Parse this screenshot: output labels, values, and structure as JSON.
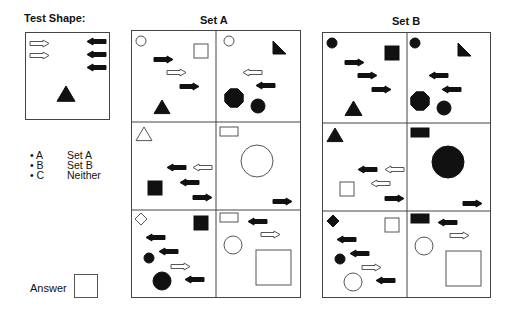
{
  "titles": {
    "test_shape": "Test Shape:",
    "set_a": "Set A",
    "set_b": "Set B"
  },
  "options": [
    {
      "key": "• A",
      "label": "Set A"
    },
    {
      "key": "• B",
      "label": "Set B"
    },
    {
      "key": "• C",
      "label": "Neither"
    }
  ],
  "answer": {
    "label": "Answer",
    "value": ""
  },
  "colors": {
    "ink": "#111111",
    "border": "#444444",
    "background": "#ffffff"
  },
  "test_shape": {
    "box": {
      "x": 25,
      "y": 32,
      "w": 85,
      "h": 88
    },
    "shapes": [
      {
        "type": "arrow",
        "dir": "right",
        "fill": "open",
        "x": 30,
        "y": 40
      },
      {
        "type": "arrow",
        "dir": "right",
        "fill": "open",
        "x": 30,
        "y": 52
      },
      {
        "type": "arrow",
        "dir": "left",
        "fill": "solid",
        "x": 87,
        "y": 38
      },
      {
        "type": "arrow",
        "dir": "left",
        "fill": "solid",
        "x": 87,
        "y": 51
      },
      {
        "type": "arrow",
        "dir": "left",
        "fill": "solid",
        "x": 87,
        "y": 64
      },
      {
        "type": "triangle",
        "fill": "solid",
        "x": 57,
        "y": 86,
        "size": 18
      }
    ]
  },
  "set_a": {
    "box": {
      "x": 131,
      "y": 30,
      "w": 170,
      "h": 268
    },
    "cells": [
      {
        "shapes": [
          {
            "type": "circle",
            "fill": "open",
            "cx": 141,
            "cy": 41,
            "r": 5
          },
          {
            "type": "square",
            "fill": "open",
            "x": 194,
            "y": 44,
            "size": 14
          },
          {
            "type": "arrow",
            "dir": "right",
            "fill": "solid",
            "x": 154,
            "y": 56
          },
          {
            "type": "arrow",
            "dir": "right",
            "fill": "open",
            "x": 167,
            "y": 69
          },
          {
            "type": "arrow",
            "dir": "right",
            "fill": "solid",
            "x": 180,
            "y": 83
          },
          {
            "type": "triangle",
            "fill": "solid",
            "x": 154,
            "y": 100,
            "size": 16
          }
        ]
      },
      {
        "shapes": [
          {
            "type": "circle",
            "fill": "open",
            "cx": 229,
            "cy": 41,
            "r": 5
          },
          {
            "type": "right-triangle",
            "fill": "solid",
            "x": 273,
            "y": 41,
            "size": 13
          },
          {
            "type": "arrow",
            "dir": "left",
            "fill": "open",
            "x": 243,
            "y": 69
          },
          {
            "type": "arrow",
            "dir": "left",
            "fill": "solid",
            "x": 256,
            "y": 82
          },
          {
            "type": "octagon",
            "fill": "solid",
            "cx": 234,
            "cy": 98,
            "r": 10
          },
          {
            "type": "circle",
            "fill": "solid",
            "cx": 258,
            "cy": 106,
            "r": 7
          }
        ]
      },
      {
        "shapes": [
          {
            "type": "triangle",
            "fill": "open",
            "x": 136,
            "y": 127,
            "size": 16
          },
          {
            "type": "arrow",
            "dir": "left",
            "fill": "open",
            "x": 193,
            "y": 164
          },
          {
            "type": "arrow",
            "dir": "left",
            "fill": "solid",
            "x": 167,
            "y": 164
          },
          {
            "type": "arrow",
            "dir": "left",
            "fill": "solid",
            "x": 180,
            "y": 179
          },
          {
            "type": "square",
            "fill": "solid",
            "x": 148,
            "y": 181,
            "size": 14
          },
          {
            "type": "arrow",
            "dir": "right",
            "fill": "solid",
            "x": 193,
            "y": 194
          }
        ]
      },
      {
        "shapes": [
          {
            "type": "rect",
            "fill": "open",
            "x": 220,
            "y": 127,
            "w": 18,
            "h": 9
          },
          {
            "type": "circle",
            "fill": "open",
            "cx": 257,
            "cy": 161,
            "r": 16
          },
          {
            "type": "arrow",
            "dir": "right",
            "fill": "solid",
            "x": 273,
            "y": 198
          }
        ]
      },
      {
        "shapes": [
          {
            "type": "diamond",
            "fill": "open",
            "cx": 141,
            "cy": 219,
            "r": 6
          },
          {
            "type": "square",
            "fill": "solid",
            "x": 194,
            "y": 216,
            "size": 14
          },
          {
            "type": "arrow",
            "dir": "left",
            "fill": "solid",
            "x": 146,
            "y": 234
          },
          {
            "type": "arrow",
            "dir": "left",
            "fill": "solid",
            "x": 159,
            "y": 248
          },
          {
            "type": "circle",
            "fill": "solid",
            "cx": 149,
            "cy": 258,
            "r": 5
          },
          {
            "type": "arrow",
            "dir": "right",
            "fill": "open",
            "x": 171,
            "y": 263
          },
          {
            "type": "arrow",
            "dir": "left",
            "fill": "solid",
            "x": 185,
            "y": 276
          },
          {
            "type": "circle",
            "fill": "solid",
            "cx": 162,
            "cy": 281,
            "r": 9
          }
        ]
      },
      {
        "shapes": [
          {
            "type": "rect",
            "fill": "open",
            "x": 220,
            "y": 213,
            "w": 18,
            "h": 9
          },
          {
            "type": "arrow",
            "dir": "left",
            "fill": "solid",
            "x": 248,
            "y": 218
          },
          {
            "type": "arrow",
            "dir": "right",
            "fill": "open",
            "x": 261,
            "y": 231
          },
          {
            "type": "circle",
            "fill": "open",
            "cx": 233,
            "cy": 245,
            "r": 9
          },
          {
            "type": "square",
            "fill": "open",
            "x": 256,
            "y": 250,
            "size": 35
          }
        ]
      }
    ]
  },
  "set_b": {
    "box": {
      "x": 322,
      "y": 32,
      "w": 169,
      "h": 266
    },
    "cells": [
      {
        "shapes": [
          {
            "type": "circle",
            "fill": "solid",
            "cx": 332,
            "cy": 43,
            "r": 5
          },
          {
            "type": "square",
            "fill": "solid",
            "x": 385,
            "y": 46,
            "size": 14
          },
          {
            "type": "arrow",
            "dir": "right",
            "fill": "solid",
            "x": 345,
            "y": 59
          },
          {
            "type": "arrow",
            "dir": "right",
            "fill": "solid",
            "x": 358,
            "y": 72
          },
          {
            "type": "arrow",
            "dir": "right",
            "fill": "solid",
            "x": 372,
            "y": 86
          },
          {
            "type": "triangle",
            "fill": "solid",
            "x": 345,
            "y": 101,
            "size": 17
          }
        ]
      },
      {
        "shapes": [
          {
            "type": "circle",
            "fill": "solid",
            "cx": 415,
            "cy": 43,
            "r": 5
          },
          {
            "type": "right-triangle",
            "fill": "solid",
            "x": 458,
            "y": 43,
            "size": 13
          },
          {
            "type": "arrow",
            "dir": "left",
            "fill": "solid",
            "x": 429,
            "y": 72
          },
          {
            "type": "arrow",
            "dir": "left",
            "fill": "solid",
            "x": 442,
            "y": 86
          },
          {
            "type": "octagon",
            "fill": "solid",
            "cx": 420,
            "cy": 101,
            "r": 10
          },
          {
            "type": "circle",
            "fill": "solid",
            "cx": 444,
            "cy": 108,
            "r": 7
          }
        ]
      },
      {
        "shapes": [
          {
            "type": "triangle",
            "fill": "solid",
            "x": 327,
            "y": 128,
            "size": 16
          },
          {
            "type": "arrow",
            "dir": "left",
            "fill": "open",
            "x": 385,
            "y": 166
          },
          {
            "type": "arrow",
            "dir": "left",
            "fill": "solid",
            "x": 358,
            "y": 166
          },
          {
            "type": "arrow",
            "dir": "left",
            "fill": "open",
            "x": 371,
            "y": 180
          },
          {
            "type": "square",
            "fill": "open",
            "x": 340,
            "y": 182,
            "size": 14
          },
          {
            "type": "arrow",
            "dir": "right",
            "fill": "solid",
            "x": 385,
            "y": 195
          }
        ]
      },
      {
        "shapes": [
          {
            "type": "rect",
            "fill": "solid",
            "x": 411,
            "y": 128,
            "w": 18,
            "h": 9
          },
          {
            "type": "circle",
            "fill": "solid",
            "cx": 448,
            "cy": 162,
            "r": 16
          },
          {
            "type": "arrow",
            "dir": "right",
            "fill": "solid",
            "x": 463,
            "y": 200
          }
        ]
      },
      {
        "shapes": [
          {
            "type": "diamond",
            "fill": "solid",
            "cx": 333,
            "cy": 221,
            "r": 6
          },
          {
            "type": "square",
            "fill": "open",
            "x": 385,
            "y": 218,
            "size": 14
          },
          {
            "type": "arrow",
            "dir": "left",
            "fill": "solid",
            "x": 337,
            "y": 236
          },
          {
            "type": "arrow",
            "dir": "left",
            "fill": "solid",
            "x": 350,
            "y": 250
          },
          {
            "type": "circle",
            "fill": "solid",
            "cx": 340,
            "cy": 259,
            "r": 5
          },
          {
            "type": "arrow",
            "dir": "right",
            "fill": "open",
            "x": 362,
            "y": 264
          },
          {
            "type": "arrow",
            "dir": "left",
            "fill": "solid",
            "x": 376,
            "y": 277
          },
          {
            "type": "circle",
            "fill": "open",
            "cx": 353,
            "cy": 282,
            "r": 9
          }
        ]
      },
      {
        "shapes": [
          {
            "type": "rect",
            "fill": "solid",
            "x": 411,
            "y": 214,
            "w": 18,
            "h": 9
          },
          {
            "type": "arrow",
            "dir": "left",
            "fill": "solid",
            "x": 438,
            "y": 219
          },
          {
            "type": "arrow",
            "dir": "right",
            "fill": "open",
            "x": 450,
            "y": 232
          },
          {
            "type": "circle",
            "fill": "open",
            "cx": 424,
            "cy": 246,
            "r": 9
          },
          {
            "type": "square",
            "fill": "open",
            "x": 446,
            "y": 251,
            "size": 35
          }
        ]
      }
    ]
  }
}
